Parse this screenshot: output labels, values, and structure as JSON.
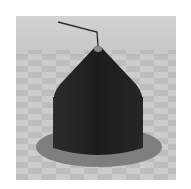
{
  "scene": {
    "description": "3D render of dark cone-topped cylinder on checkered floor with elliptical shadow and thin wire from apex",
    "colors": {
      "page_background": "#ffffff",
      "floor_light": "#c8c8c8",
      "floor_dark": "#b6b6b6",
      "sky": "#cfcfcf",
      "shadow_disc": "#7e7e7e",
      "object_body": "#202020",
      "object_edge": "#3a3a3a",
      "apex_cap": "#8a8a8a",
      "wire": "#2a2a2a"
    }
  }
}
